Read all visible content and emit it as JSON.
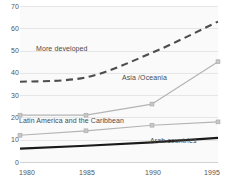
{
  "chart_data": {
    "type": "line",
    "title": "",
    "subtitle": "",
    "xlabel": "",
    "ylabel": "",
    "x": [
      1980,
      1985,
      1990,
      1995
    ],
    "xtick_labels": [
      "1980",
      "1985",
      "1990",
      "1995"
    ],
    "ytick_labels": [
      "0",
      "10",
      "20",
      "30",
      "40",
      "50",
      "60",
      "70"
    ],
    "yticks": [
      0,
      10,
      20,
      30,
      40,
      50,
      60,
      70
    ],
    "xlim": [
      1980,
      1995
    ],
    "ylim": [
      0,
      70
    ],
    "grid": true,
    "legend_position": "inline-annotations",
    "series": [
      {
        "name": "More developed",
        "label": "More developed",
        "style": "dashed",
        "color": "#4d4d4d",
        "markers": false,
        "values": [
          36,
          38,
          49,
          63
        ]
      },
      {
        "name": "Asia /Oceania",
        "label": "Asia /Oceania",
        "style": "solid",
        "color": "#b4b4b4",
        "markers": true,
        "values": [
          21,
          21,
          26,
          45
        ]
      },
      {
        "name": "Latin America and the Caribbean",
        "label": "Latin America and the Caribbean",
        "style": "solid",
        "color": "#b4b4b4",
        "markers": true,
        "values": [
          12,
          14,
          16.5,
          18
        ]
      },
      {
        "name": "Arab countries",
        "label": "Arab countries",
        "style": "solid-thick",
        "color": "#1a1a1a",
        "markers": false,
        "values": [
          6,
          7.3,
          8.8,
          10.8
        ]
      }
    ],
    "annotations": [
      {
        "text": "More developed",
        "x_px": 36,
        "y_px": 45
      },
      {
        "text": "Asia /Oceania",
        "x_px": 122,
        "y_px": 74
      },
      {
        "text": "Latin America and the Caribbean",
        "x_px": 19,
        "y_px": 117
      },
      {
        "text": "Arab countries",
        "x_px": 150,
        "y_px": 137
      }
    ]
  },
  "colors": {
    "plot_background": "#fafafa",
    "gridline": "#e6e6e6",
    "tick_text": "#555555",
    "annotation_text": "#4a4a4a"
  }
}
